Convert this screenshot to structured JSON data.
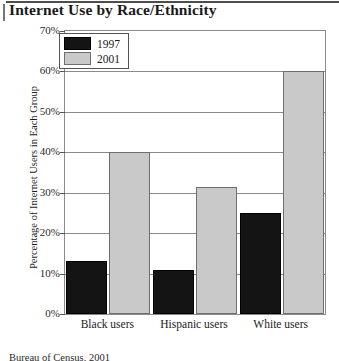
{
  "chart_data": {
    "type": "bar",
    "title": "Internet Use by Race/Ethnicity",
    "xlabel": "",
    "ylabel": "Percentage of Internet Users in Each Group",
    "categories": [
      "Black users",
      "Hispanic users",
      "White users"
    ],
    "series": [
      {
        "name": "1997",
        "color": "#141414",
        "values": [
          13,
          11,
          25
        ]
      },
      {
        "name": "2001",
        "color": "#c9c9c9",
        "values": [
          40,
          31.5,
          60
        ]
      }
    ],
    "ylim": [
      0,
      70
    ],
    "ytick_values": [
      0,
      10,
      20,
      30,
      40,
      50,
      60,
      70
    ],
    "ytick_labels": [
      "0%",
      "10%",
      "20%",
      "30%",
      "40%",
      "50%",
      "60%",
      "70%"
    ],
    "grid": true,
    "legend_position": "top-left"
  },
  "source_note": "Bureau of Census, 2001"
}
